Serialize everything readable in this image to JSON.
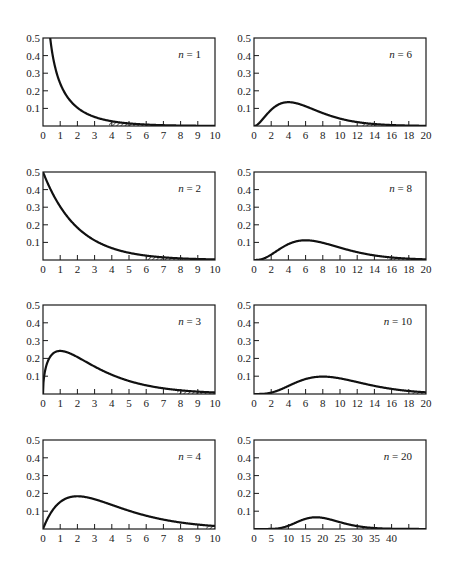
{
  "chart_data": [
    {
      "type": "line",
      "distribution": "chi-square",
      "n": 1,
      "label_var": "n",
      "label_eq": " = 1",
      "xlim": [
        0,
        10
      ],
      "ylim": [
        0,
        0.5
      ],
      "xticks": [
        0,
        1,
        2,
        3,
        4,
        5,
        6,
        7,
        8,
        9,
        10
      ],
      "xtick_labels": [
        "0",
        "1",
        "2",
        "3",
        "4",
        "5",
        "6",
        "7",
        "8",
        "9",
        "10"
      ],
      "yticks": [
        0.1,
        0.2,
        0.3,
        0.4,
        0.5
      ],
      "ytick_labels": [
        "0.1",
        "0.2",
        "0.3",
        "0.4",
        "0.5"
      ],
      "shaded_region": [
        3.84,
        6.3
      ]
    },
    {
      "type": "line",
      "distribution": "chi-square",
      "n": 6,
      "label_var": "n",
      "label_eq": " = 6",
      "xlim": [
        0,
        20
      ],
      "ylim": [
        0,
        0.5
      ],
      "xticks": [
        0,
        2,
        4,
        6,
        8,
        10,
        12,
        14,
        16,
        18,
        20
      ],
      "xtick_labels": [
        "0",
        "2",
        "4",
        "6",
        "8",
        "10",
        "12",
        "14",
        "16",
        "18",
        "20"
      ],
      "yticks": [
        0.1,
        0.2,
        0.3,
        0.4,
        0.5
      ],
      "ytick_labels": [
        "0.1",
        "0.2",
        "0.3",
        "0.4",
        "0.5"
      ],
      "shaded_region": [
        12.59,
        14.5
      ]
    },
    {
      "type": "line",
      "distribution": "chi-square",
      "n": 2,
      "label_var": "n",
      "label_eq": " = 2",
      "xlim": [
        0,
        10
      ],
      "ylim": [
        0,
        0.5
      ],
      "xticks": [
        0,
        1,
        2,
        3,
        4,
        5,
        6,
        7,
        8,
        9,
        10
      ],
      "xtick_labels": [
        "0",
        "1",
        "2",
        "3",
        "4",
        "5",
        "6",
        "7",
        "8",
        "9",
        "10"
      ],
      "yticks": [
        0.1,
        0.2,
        0.3,
        0.4,
        0.5
      ],
      "ytick_labels": [
        "0.1",
        "0.2",
        "0.3",
        "0.4",
        "0.5"
      ],
      "shaded_region": [
        5.99,
        8.3
      ]
    },
    {
      "type": "line",
      "distribution": "chi-square",
      "n": 8,
      "label_var": "n",
      "label_eq": " = 8",
      "xlim": [
        0,
        20
      ],
      "ylim": [
        0,
        0.5
      ],
      "xticks": [
        0,
        2,
        4,
        6,
        8,
        10,
        12,
        14,
        16,
        18,
        20
      ],
      "xtick_labels": [
        "0",
        "2",
        "4",
        "6",
        "8",
        "10",
        "12",
        "14",
        "16",
        "18",
        "20"
      ],
      "yticks": [
        0.1,
        0.2,
        0.3,
        0.4,
        0.5
      ],
      "ytick_labels": [
        "0.1",
        "0.2",
        "0.3",
        "0.4",
        "0.5"
      ],
      "shaded_region": [
        15.51,
        20
      ]
    },
    {
      "type": "line",
      "distribution": "chi-square",
      "n": 3,
      "label_var": "n",
      "label_eq": " = 3",
      "xlim": [
        0,
        10
      ],
      "ylim": [
        0,
        0.5
      ],
      "xticks": [
        0,
        1,
        2,
        3,
        4,
        5,
        6,
        7,
        8,
        9,
        10
      ],
      "xtick_labels": [
        "0",
        "1",
        "2",
        "3",
        "4",
        "5",
        "6",
        "7",
        "8",
        "9",
        "10"
      ],
      "yticks": [
        0.1,
        0.2,
        0.3,
        0.4,
        0.5
      ],
      "ytick_labels": [
        "0.1",
        "0.2",
        "0.3",
        "0.4",
        "0.5"
      ],
      "shaded_region": [
        7.81,
        10
      ]
    },
    {
      "type": "line",
      "distribution": "chi-square",
      "n": 10,
      "label_var": "n",
      "label_eq": " = 10",
      "xlim": [
        0,
        20
      ],
      "ylim": [
        0,
        0.5
      ],
      "xticks": [
        0,
        2,
        4,
        6,
        8,
        10,
        12,
        14,
        16,
        18,
        20
      ],
      "xtick_labels": [
        "0",
        "2",
        "4",
        "6",
        "8",
        "10",
        "12",
        "14",
        "16",
        "18",
        "20"
      ],
      "yticks": [
        0.1,
        0.2,
        0.3,
        0.4,
        0.5
      ],
      "ytick_labels": [
        "0.1",
        "0.2",
        "0.3",
        "0.4",
        "0.5"
      ],
      "shaded_region": [
        18.31,
        20
      ]
    },
    {
      "type": "line",
      "distribution": "chi-square",
      "n": 4,
      "label_var": "n",
      "label_eq": " = 4",
      "xlim": [
        0,
        10
      ],
      "ylim": [
        0,
        0.5
      ],
      "xticks": [
        0,
        1,
        2,
        3,
        4,
        5,
        6,
        7,
        8,
        9,
        10
      ],
      "xtick_labels": [
        "0",
        "1",
        "2",
        "3",
        "4",
        "5",
        "6",
        "7",
        "8",
        "9",
        "10"
      ],
      "yticks": [
        0.1,
        0.2,
        0.3,
        0.4,
        0.5
      ],
      "ytick_labels": [
        "0.1",
        "0.2",
        "0.3",
        "0.4",
        "0.5"
      ],
      "shaded_region": [
        9.49,
        10
      ]
    },
    {
      "type": "line",
      "distribution": "chi-square",
      "n": 20,
      "label_var": "n",
      "label_eq": " = 20",
      "xlim": [
        0,
        50
      ],
      "ylim": [
        0,
        0.5
      ],
      "xticks": [
        0,
        5,
        10,
        15,
        20,
        25,
        30,
        35,
        40,
        45
      ],
      "xtick_labels": [
        "0",
        "5",
        "10",
        "15",
        "20",
        "25",
        "30",
        "35",
        "40",
        ""
      ],
      "yticks": [
        0.1,
        0.2,
        0.3,
        0.4,
        0.5
      ],
      "ytick_labels": [
        "0.1",
        "0.2",
        "0.3",
        "0.4",
        "0.5"
      ],
      "shaded_region": [
        31.41,
        36
      ]
    }
  ]
}
